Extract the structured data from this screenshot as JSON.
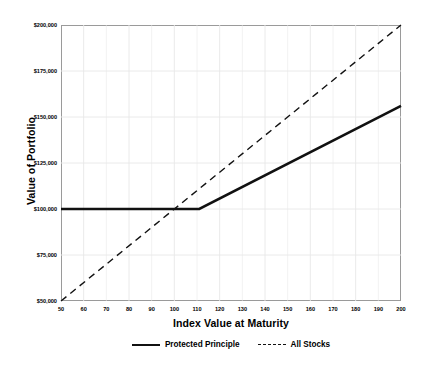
{
  "chart_data": {
    "type": "line",
    "title": "",
    "xlabel": "Index Value at Maturity",
    "ylabel": "Value of Portfolio",
    "xlim": [
      50,
      200
    ],
    "ylim": [
      50000,
      200000
    ],
    "xticks": [
      50,
      60,
      70,
      80,
      90,
      100,
      110,
      120,
      130,
      140,
      150,
      160,
      170,
      180,
      190,
      200
    ],
    "xticklabels": [
      "50",
      "60",
      "70",
      "80",
      "90",
      "100",
      "110",
      "120",
      "130",
      "140",
      "150",
      "160",
      "170",
      "180",
      "190",
      "200"
    ],
    "yticks": [
      50000,
      75000,
      100000,
      125000,
      150000,
      175000,
      200000
    ],
    "yticklabels": [
      "$50,000",
      "$75,000",
      "$100,000",
      "$125,000",
      "$150,000",
      "$175,000",
      "$200,000"
    ],
    "grid": true,
    "grid_color": "#e8e8e8",
    "legend_position": "bottom-center",
    "series": [
      {
        "name": "Protected Principle",
        "style": "solid",
        "color": "#111111",
        "width": 2.6,
        "points": [
          {
            "x": 50,
            "y": 100000
          },
          {
            "x": 111,
            "y": 100000
          },
          {
            "x": 200,
            "y": 156000
          }
        ]
      },
      {
        "name": "All Stocks",
        "style": "dashed",
        "color": "#111111",
        "width": 1.4,
        "points": [
          {
            "x": 50,
            "y": 50000
          },
          {
            "x": 200,
            "y": 200000
          }
        ]
      }
    ]
  },
  "axes": {
    "y_title": "Value of Portfolio",
    "x_title": "Index Value at Maturity"
  },
  "legend": {
    "items": [
      {
        "label": "Protected Principle",
        "style": "solid"
      },
      {
        "label": "All Stocks",
        "style": "dashed"
      }
    ]
  }
}
